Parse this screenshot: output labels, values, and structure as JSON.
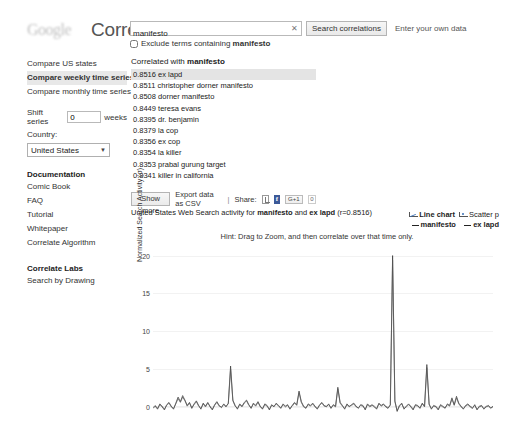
{
  "header": {
    "logo_text": "Google",
    "brand": "Correlate",
    "search_value": "manifesto",
    "search_placeholder": "Enter a search term",
    "clear_icon": "clear-x-icon",
    "search_button": "Search correlations",
    "own_data_link": "Enter your own data",
    "exclude_label_prefix": "Exclude terms containing ",
    "exclude_term": "manifesto",
    "exclude_checked": false
  },
  "sidebar": {
    "modes": [
      {
        "label": "Compare US states",
        "selected": false
      },
      {
        "label": "Compare weekly time series",
        "selected": true
      },
      {
        "label": "Compare monthly time series",
        "selected": false
      }
    ],
    "shift_label": "Shift series",
    "shift_value": "0",
    "shift_unit": "weeks",
    "country_label": "Country:",
    "country_value": "United States",
    "caret_icon": "chevron-down-icon",
    "documentation_heading": "Documentation",
    "documentation_links": [
      "Comic Book",
      "FAQ",
      "Tutorial",
      "Whitepaper",
      "Correlate Algorithm"
    ],
    "labs_heading": "Correlate Labs",
    "labs_links": [
      "Search by Drawing"
    ]
  },
  "results": {
    "heading_prefix": "Correlated with ",
    "heading_term": "manifesto",
    "rows": [
      {
        "value": "0.8516",
        "term": "ex lapd",
        "selected": true
      },
      {
        "value": "0.8511",
        "term": "christopher dorner manifesto",
        "selected": false
      },
      {
        "value": "0.8508",
        "term": "dorner manifesto",
        "selected": false
      },
      {
        "value": "0.8449",
        "term": "teresa evans",
        "selected": false
      },
      {
        "value": "0.8395",
        "term": "dr. benjamin",
        "selected": false
      },
      {
        "value": "0.8379",
        "term": "la cop",
        "selected": false
      },
      {
        "value": "0.8356",
        "term": "ex cop",
        "selected": false
      },
      {
        "value": "0.8354",
        "term": "la killer",
        "selected": false
      },
      {
        "value": "0.8353",
        "term": "prabal gurung target",
        "selected": false
      },
      {
        "value": "0.8341",
        "term": "killer in california",
        "selected": false
      }
    ],
    "show_more": "Show more",
    "export_csv": "Export data as CSV",
    "separator": "|",
    "share_label": "Share:",
    "share_icons": [
      "twitter-icon",
      "facebook-icon",
      "google-plus-icon"
    ],
    "gplus_label": "G+1",
    "gplus_count": "0"
  },
  "chart_header": {
    "title_prefix": "United States Web Search activity for ",
    "title_term_a": "manifesto",
    "title_join": " and ",
    "title_term_b": "ex lapd",
    "title_suffix": " (r=0.8516)",
    "hint": "Hint: Drag to Zoom, and then correlate over that time only.",
    "line_chart_label": "Line chart",
    "scatter_label": "Scatter p",
    "legend_a": "manifesto",
    "legend_b": "ex lapd"
  },
  "chart_data": {
    "type": "line",
    "title": "United States Web Search activity for manifesto and ex lapd (r=0.8516)",
    "xlabel": "",
    "ylabel": "Normalized Search Activity (σ)",
    "ylim": [
      -1.2,
      21
    ],
    "yticks": [
      0,
      5,
      10,
      15,
      20
    ],
    "grid": true,
    "legend_position": "top-right",
    "correlation_r": 0.8516,
    "series": [
      {
        "name": "manifesto",
        "color": "#333333",
        "values": [
          -0.2,
          0.1,
          -0.3,
          0.4,
          0.0,
          -0.4,
          0.3,
          0.6,
          0.1,
          -0.3,
          0.5,
          1.3,
          0.7,
          1.5,
          0.9,
          0.2,
          0.6,
          -0.2,
          0.4,
          0.8,
          0.2,
          -0.3,
          0.5,
          0.1,
          0.6,
          0.0,
          -0.4,
          0.3,
          0.7,
          0.2,
          -0.1,
          0.4,
          0.0,
          0.5,
          5.4,
          0.9,
          0.2,
          -0.3,
          0.4,
          0.1,
          0.6,
          0.9,
          0.3,
          -0.2,
          0.5,
          0.2,
          0.7,
          0.1,
          -0.3,
          0.4,
          0.2,
          -0.4,
          0.3,
          0.0,
          0.5,
          0.2,
          -0.2,
          0.4,
          0.1,
          0.3,
          -0.3,
          0.2,
          0.6,
          0.3,
          2.1,
          0.7,
          0.1,
          -0.2,
          0.4,
          0.2,
          0.5,
          0.1,
          -0.3,
          0.3,
          0.6,
          0.2,
          0.0,
          0.4,
          -0.2,
          0.3,
          0.1,
          2.6,
          0.6,
          0.2,
          -0.3,
          0.4,
          0.0,
          0.3,
          0.5,
          0.1,
          -0.2,
          0.3,
          0.2,
          -0.4,
          0.4,
          0.1,
          0.3,
          0.0,
          -0.3,
          0.5,
          0.2,
          0.4,
          0.0,
          -0.2,
          0.3,
          20.0,
          0.8,
          -0.6,
          0.2,
          0.5,
          -0.3,
          0.1,
          0.4,
          0.0,
          -0.4,
          0.3,
          0.2,
          -0.2,
          0.5,
          0.1,
          5.6,
          0.4,
          -0.3,
          0.2,
          0.0,
          -0.4,
          0.3,
          0.1,
          -0.2,
          0.4,
          0.2,
          1.2,
          0.3,
          1.4,
          0.5,
          0.1,
          -0.3,
          0.2,
          0.4,
          0.0,
          -0.2,
          0.3,
          -0.4,
          0.1,
          0.2,
          -0.3,
          0.0,
          0.2,
          -0.2,
          0.1
        ]
      },
      {
        "name": "ex lapd",
        "color": "#555555",
        "values": [
          -0.1,
          0.2,
          -0.2,
          0.3,
          0.1,
          -0.3,
          0.2,
          0.5,
          0.0,
          -0.2,
          0.4,
          1.1,
          0.6,
          1.3,
          0.8,
          0.1,
          0.5,
          -0.1,
          0.3,
          0.7,
          0.1,
          -0.2,
          0.4,
          0.0,
          0.5,
          0.1,
          -0.3,
          0.2,
          0.6,
          0.1,
          0.0,
          0.3,
          0.1,
          0.4,
          5.0,
          0.8,
          0.1,
          -0.2,
          0.3,
          0.0,
          0.5,
          0.8,
          0.2,
          -0.1,
          0.4,
          0.1,
          0.6,
          0.0,
          -0.2,
          0.3,
          0.1,
          -0.3,
          0.2,
          0.1,
          0.4,
          0.1,
          -0.1,
          0.3,
          0.0,
          0.2,
          -0.2,
          0.1,
          0.5,
          0.2,
          1.9,
          0.6,
          0.0,
          -0.1,
          0.3,
          0.1,
          0.4,
          0.0,
          -0.2,
          0.2,
          0.5,
          0.1,
          0.1,
          0.3,
          -0.1,
          0.2,
          0.0,
          2.4,
          0.5,
          0.1,
          -0.2,
          0.3,
          0.1,
          0.2,
          0.4,
          0.0,
          -0.1,
          0.2,
          0.1,
          -0.3,
          0.3,
          0.0,
          0.2,
          0.1,
          -0.2,
          0.4,
          0.1,
          0.3,
          0.1,
          -0.1,
          0.2,
          19.4,
          0.7,
          -0.5,
          0.1,
          0.4,
          -0.2,
          0.0,
          0.3,
          0.1,
          -0.3,
          0.2,
          0.1,
          -0.1,
          0.4,
          0.0,
          5.2,
          0.3,
          -0.2,
          0.1,
          0.1,
          -0.3,
          0.2,
          0.0,
          -0.1,
          0.3,
          0.1,
          1.0,
          0.2,
          1.2,
          0.4,
          0.0,
          -0.2,
          0.1,
          0.3,
          0.1,
          -0.1,
          0.2,
          -0.3,
          0.0,
          0.1,
          -0.2,
          0.1,
          0.1,
          -0.1,
          0.0
        ]
      }
    ]
  }
}
